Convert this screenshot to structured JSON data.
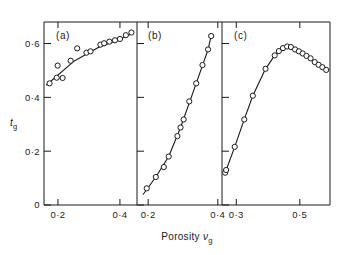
{
  "figure": {
    "xlabel_text": "Porosity",
    "xlabel_symbol": "ν",
    "xlabel_symbol_sub": "g",
    "ylabel_symbol": "t",
    "ylabel_symbol_sub": "g"
  },
  "yaxis": {
    "ticks": [
      {
        "value": 0.6,
        "label": "0·6"
      },
      {
        "value": 0.4,
        "label": "0·4"
      },
      {
        "value": 0.2,
        "label": "0·2"
      },
      {
        "value": 0.0,
        "label": "0"
      }
    ]
  },
  "panels": [
    {
      "id": "a",
      "label": "(a)",
      "xticks": [
        {
          "value": 0.2,
          "label": "0·2"
        },
        {
          "value": 0.4,
          "label": "0·4"
        }
      ]
    },
    {
      "id": "b",
      "label": "(b)",
      "xticks": [
        {
          "value": 0.2,
          "label": "0·2"
        },
        {
          "value": 0.4,
          "label": "0·4"
        }
      ]
    },
    {
      "id": "c",
      "label": "(c)",
      "xticks": [
        {
          "value": 0.3,
          "label": "0·3"
        },
        {
          "value": 0.5,
          "label": "0·5"
        }
      ]
    }
  ],
  "chart_data": {
    "type": "scatter",
    "title": "",
    "xlabel": "Porosity νg",
    "ylabel": "tg",
    "ylim": [
      0.0,
      0.68
    ],
    "grid": false,
    "legend": "none",
    "panels": [
      {
        "id": "a",
        "label": "(a)",
        "xlim": [
          0.155,
          0.455
        ],
        "xticks": [
          0.2,
          0.4
        ],
        "markers": {
          "shape": "open-circle"
        },
        "points": [
          {
            "x": 0.173,
            "y": 0.452
          },
          {
            "x": 0.196,
            "y": 0.473
          },
          {
            "x": 0.199,
            "y": 0.518
          },
          {
            "x": 0.215,
            "y": 0.472
          },
          {
            "x": 0.241,
            "y": 0.536
          },
          {
            "x": 0.262,
            "y": 0.582
          },
          {
            "x": 0.292,
            "y": 0.566
          },
          {
            "x": 0.305,
            "y": 0.571
          },
          {
            "x": 0.337,
            "y": 0.596
          },
          {
            "x": 0.349,
            "y": 0.601
          },
          {
            "x": 0.366,
            "y": 0.607
          },
          {
            "x": 0.384,
            "y": 0.612
          },
          {
            "x": 0.4,
            "y": 0.617
          },
          {
            "x": 0.419,
            "y": 0.631
          },
          {
            "x": 0.437,
            "y": 0.641
          }
        ],
        "fit_line": [
          {
            "x": 0.163,
            "y": 0.446
          },
          {
            "x": 0.25,
            "y": 0.533
          },
          {
            "x": 0.33,
            "y": 0.585
          },
          {
            "x": 0.4,
            "y": 0.616
          },
          {
            "x": 0.443,
            "y": 0.639
          }
        ]
      },
      {
        "id": "b",
        "label": "(b)",
        "xlim": [
          0.168,
          0.412
        ],
        "xticks": [
          0.2,
          0.4
        ],
        "markers": {
          "shape": "open-circle"
        },
        "points": [
          {
            "x": 0.196,
            "y": 0.062
          },
          {
            "x": 0.222,
            "y": 0.104
          },
          {
            "x": 0.245,
            "y": 0.141
          },
          {
            "x": 0.259,
            "y": 0.18
          },
          {
            "x": 0.284,
            "y": 0.256
          },
          {
            "x": 0.293,
            "y": 0.288
          },
          {
            "x": 0.302,
            "y": 0.318
          },
          {
            "x": 0.318,
            "y": 0.385
          },
          {
            "x": 0.338,
            "y": 0.452
          },
          {
            "x": 0.356,
            "y": 0.52
          },
          {
            "x": 0.372,
            "y": 0.578
          },
          {
            "x": 0.381,
            "y": 0.628
          }
        ],
        "fit_line": [
          {
            "x": 0.186,
            "y": 0.04
          },
          {
            "x": 0.222,
            "y": 0.104
          },
          {
            "x": 0.259,
            "y": 0.18
          },
          {
            "x": 0.293,
            "y": 0.288
          },
          {
            "x": 0.338,
            "y": 0.452
          },
          {
            "x": 0.372,
            "y": 0.578
          },
          {
            "x": 0.381,
            "y": 0.628
          }
        ]
      },
      {
        "id": "c",
        "label": "(c)",
        "xlim": [
          0.255,
          0.595
        ],
        "xticks": [
          0.3,
          0.5
        ],
        "markers": {
          "shape": "open-circle"
        },
        "points": [
          {
            "x": 0.265,
            "y": 0.12
          },
          {
            "x": 0.268,
            "y": 0.13
          },
          {
            "x": 0.295,
            "y": 0.216
          },
          {
            "x": 0.325,
            "y": 0.318
          },
          {
            "x": 0.352,
            "y": 0.406
          },
          {
            "x": 0.392,
            "y": 0.506
          },
          {
            "x": 0.421,
            "y": 0.556
          },
          {
            "x": 0.434,
            "y": 0.572
          },
          {
            "x": 0.447,
            "y": 0.583
          },
          {
            "x": 0.46,
            "y": 0.589
          },
          {
            "x": 0.472,
            "y": 0.587
          },
          {
            "x": 0.485,
            "y": 0.578
          },
          {
            "x": 0.497,
            "y": 0.571
          },
          {
            "x": 0.509,
            "y": 0.563
          },
          {
            "x": 0.521,
            "y": 0.554
          },
          {
            "x": 0.534,
            "y": 0.545
          },
          {
            "x": 0.547,
            "y": 0.531
          },
          {
            "x": 0.559,
            "y": 0.521
          },
          {
            "x": 0.571,
            "y": 0.512
          },
          {
            "x": 0.583,
            "y": 0.502
          }
        ],
        "fit_line": [
          {
            "x": 0.265,
            "y": 0.12
          },
          {
            "x": 0.295,
            "y": 0.216
          },
          {
            "x": 0.325,
            "y": 0.318
          },
          {
            "x": 0.352,
            "y": 0.406
          },
          {
            "x": 0.392,
            "y": 0.506
          },
          {
            "x": 0.421,
            "y": 0.556
          },
          {
            "x": 0.447,
            "y": 0.583
          },
          {
            "x": 0.46,
            "y": 0.589
          },
          {
            "x": 0.485,
            "y": 0.578
          },
          {
            "x": 0.509,
            "y": 0.563
          },
          {
            "x": 0.534,
            "y": 0.545
          },
          {
            "x": 0.559,
            "y": 0.521
          },
          {
            "x": 0.583,
            "y": 0.502
          }
        ]
      }
    ]
  }
}
